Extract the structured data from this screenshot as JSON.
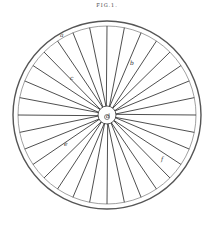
{
  "figure": {
    "title": "FIG.1.",
    "spoke_count": 32,
    "labels": [
      {
        "text": "a",
        "x": 60,
        "y": 37
      },
      {
        "text": "b",
        "x": 130,
        "y": 65
      },
      {
        "text": "c",
        "x": 70,
        "y": 80
      },
      {
        "text": "d",
        "x": 106,
        "y": 118
      },
      {
        "text": "e",
        "x": 64,
        "y": 146
      },
      {
        "text": "f",
        "x": 161,
        "y": 161
      }
    ],
    "colors": {
      "line": "#222222",
      "rim": "#555555",
      "background": "#ffffff"
    }
  }
}
